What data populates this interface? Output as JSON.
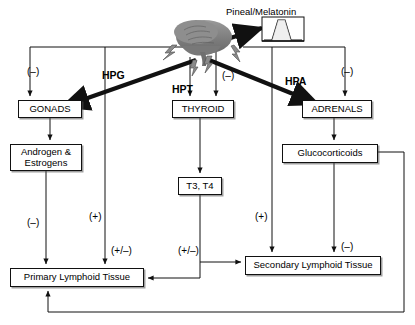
{
  "figure": {
    "background_color": "#ffffff",
    "line_color": "#111111"
  },
  "nodes": [
    {
      "id": "gonads",
      "label": "GONADS",
      "x": 18,
      "y": 100,
      "w": 64,
      "h": 18
    },
    {
      "id": "androgen",
      "label": "Androgen &\nEstrogens",
      "x": 10,
      "y": 144,
      "w": 72,
      "h": 27
    },
    {
      "id": "thyroid",
      "label": "THYROID",
      "x": 172,
      "y": 100,
      "w": 62,
      "h": 18
    },
    {
      "id": "t3t4",
      "label": "T3, T4",
      "x": 178,
      "y": 177,
      "w": 44,
      "h": 18
    },
    {
      "id": "adrenals",
      "label": "ADRENALS",
      "x": 302,
      "y": 100,
      "w": 70,
      "h": 18
    },
    {
      "id": "glucocort",
      "label": "Glucocorticoids",
      "x": 282,
      "y": 144,
      "w": 96,
      "h": 19
    },
    {
      "id": "primary",
      "label": "Primary  Lymphoid Tissue",
      "x": 10,
      "y": 268,
      "w": 134,
      "h": 19
    },
    {
      "id": "secondary",
      "label": "Secondary  Lymphoid Tissue",
      "x": 245,
      "y": 256,
      "w": 136,
      "h": 19
    }
  ],
  "axis_labels": [
    {
      "id": "hpg",
      "text": "HPG",
      "x": 102,
      "y": 69
    },
    {
      "id": "hpt",
      "text": "HPT",
      "x": 172,
      "y": 83
    },
    {
      "id": "hpa",
      "text": "HPA",
      "x": 285,
      "y": 75
    }
  ],
  "signs": [
    {
      "id": "sign-gonads-inhibit",
      "text": "(–)",
      "x": 27,
      "y": 66
    },
    {
      "id": "sign-androgen-primary",
      "text": "(–)",
      "x": 27,
      "y": 217
    },
    {
      "id": "sign-brain-primary",
      "text": "(+)",
      "x": 89,
      "y": 211
    },
    {
      "id": "sign-primary-feedback",
      "text": "(+/–)",
      "x": 111,
      "y": 245
    },
    {
      "id": "sign-t3t4-lymphoid",
      "text": "(+/–)",
      "x": 178,
      "y": 245
    },
    {
      "id": "sign-thyroid-inhibit",
      "text": "(–)",
      "x": 222,
      "y": 70
    },
    {
      "id": "sign-brain-secondary",
      "text": "(+)",
      "x": 255,
      "y": 211
    },
    {
      "id": "sign-adrenals-inhibit",
      "text": "(–)",
      "x": 341,
      "y": 66
    },
    {
      "id": "sign-gluco-secondary",
      "text": "(–)",
      "x": 341,
      "y": 241
    }
  ],
  "annotations": [
    {
      "id": "pineal-caption",
      "text": "Pineal/Melatonin",
      "x": 226,
      "y": 6
    }
  ],
  "icons": {
    "brain": "brain-sagittal-icon",
    "melatonin_plot": "melatonin-rhythm-plot-icon",
    "lightning_left": "lightning-bolt-icon",
    "lightning_center": "lightning-bolt-icon",
    "lightning_right": "lightning-bolt-icon"
  }
}
